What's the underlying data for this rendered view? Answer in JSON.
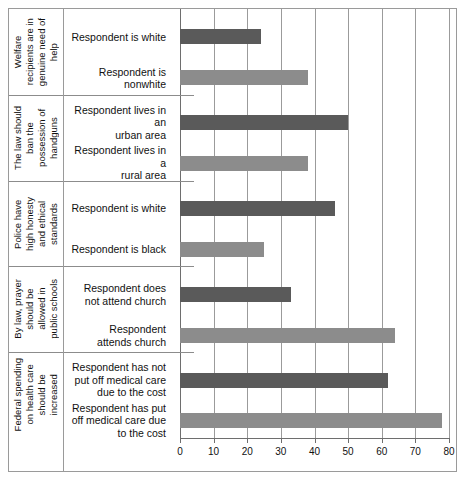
{
  "chart_data": {
    "type": "bar",
    "orientation": "horizontal",
    "title": "",
    "xlabel": "",
    "ylabel": "",
    "xlim": [
      0,
      80
    ],
    "xticks": [
      0,
      10,
      20,
      30,
      40,
      50,
      60,
      70,
      80
    ],
    "grid": true,
    "legend": "none",
    "colors": {
      "dark": "#5a5a5a",
      "light": "#8c8c8c",
      "frame": "#9a9a9a",
      "text": "#111111"
    },
    "groups": [
      {
        "group_label": "Welfare\nrecipients are in\ngenuine need of\nhelp",
        "bars": [
          {
            "category": "Respondent is white",
            "value": 24,
            "shade": "dark"
          },
          {
            "category": "Respondent is nonwhite",
            "value": 38,
            "shade": "light"
          }
        ]
      },
      {
        "group_label": "The law should\nban the\npossession of\nhandguns",
        "bars": [
          {
            "category": "Respondent lives in an\nurban area",
            "value": 50,
            "shade": "dark"
          },
          {
            "category": "Respondent lives in a\nrural area",
            "value": 38,
            "shade": "light"
          }
        ]
      },
      {
        "group_label": "Police have\nhigh honesty\nand ethical\nstandards",
        "bars": [
          {
            "category": "Respondent is white",
            "value": 46,
            "shade": "dark"
          },
          {
            "category": "Respondent is black",
            "value": 25,
            "shade": "light"
          }
        ]
      },
      {
        "group_label": "By law, prayer\nshould be\nallowed in\npublic schools",
        "bars": [
          {
            "category": "Respondent does\nnot attend church",
            "value": 33,
            "shade": "dark"
          },
          {
            "category": "Respondent\nattends church",
            "value": 64,
            "shade": "light"
          }
        ]
      },
      {
        "group_label": "Federal spending\non health care\nshould be\nincreased",
        "bars": [
          {
            "category": "Respondent has not\nput off medical care\ndue to the cost",
            "value": 62,
            "shade": "dark"
          },
          {
            "category": "Respondent has put\noff medical care due\nto the cost",
            "value": 78,
            "shade": "light"
          }
        ]
      }
    ]
  }
}
